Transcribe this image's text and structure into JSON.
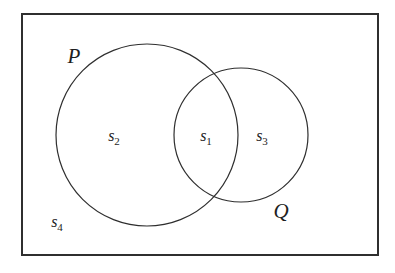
{
  "figure": {
    "type": "venn-diagram",
    "background_color": "#ffffff",
    "stroke_color": "#2f2f2f",
    "text_color": "#1e1e1e"
  },
  "universe": {
    "shape": "rectangle",
    "x": 22,
    "y": 14,
    "width": 356,
    "height": 241,
    "border_width": 2
  },
  "sets": [
    {
      "name": "P",
      "label": "P",
      "cx": 147,
      "cy": 135,
      "r": 91,
      "label_x": 74,
      "label_y": 63
    },
    {
      "name": "Q",
      "label": "Q",
      "cx": 241,
      "cy": 135,
      "r": 67,
      "label_x": 281,
      "label_y": 218
    }
  ],
  "regions": [
    {
      "id": "s1",
      "base": "s",
      "sub": "1",
      "meaning": "P-intersect-Q",
      "x": 206,
      "y": 141
    },
    {
      "id": "s2",
      "base": "s",
      "sub": "2",
      "meaning": "P-only",
      "x": 114,
      "y": 141
    },
    {
      "id": "s3",
      "base": "s",
      "sub": "3",
      "meaning": "Q-only",
      "x": 262,
      "y": 141
    },
    {
      "id": "s4",
      "base": "s",
      "sub": "4",
      "meaning": "outside-both",
      "x": 57,
      "y": 227
    }
  ]
}
